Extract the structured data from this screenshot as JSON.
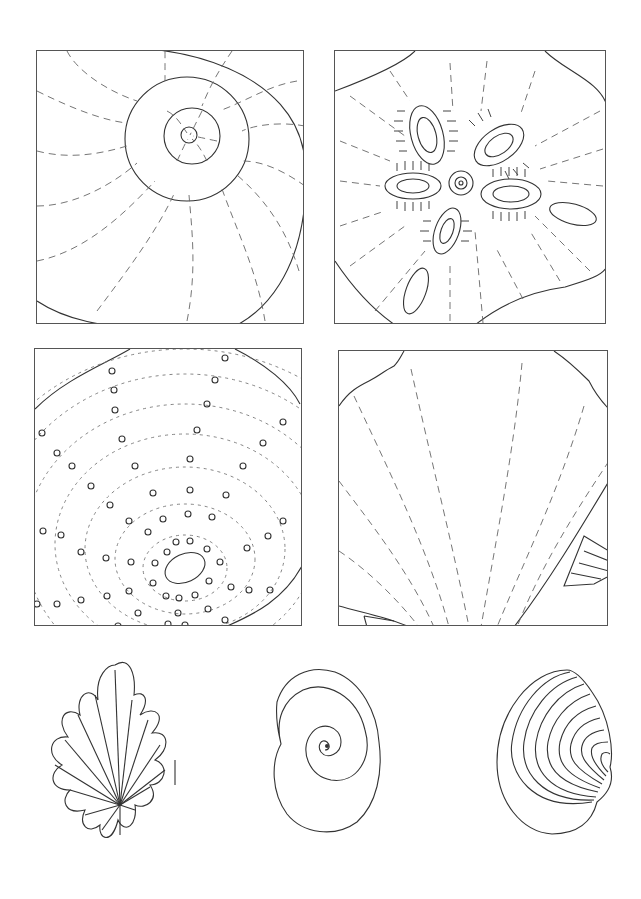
{
  "page": {
    "background": "#ffffff",
    "line_color": "#333333",
    "dash_color": "#666666"
  },
  "panels": [
    {
      "id": "nautilus-spiral",
      "x": 36,
      "y": 50,
      "w": 268,
      "h": 274
    },
    {
      "id": "sand-dollar",
      "x": 334,
      "y": 50,
      "w": 272,
      "h": 274
    },
    {
      "id": "spiral-dots-shell",
      "x": 34,
      "y": 348,
      "w": 268,
      "h": 278
    },
    {
      "id": "scallop-fan",
      "x": 338,
      "y": 350,
      "w": 270,
      "h": 276
    }
  ],
  "bottom_shells": [
    {
      "id": "fluted-shell",
      "x": 45,
      "y": 660,
      "w": 120,
      "h": 185
    },
    {
      "id": "moon-snail-spiral",
      "x": 265,
      "y": 665,
      "w": 110,
      "h": 175
    },
    {
      "id": "ribbed-clam",
      "x": 495,
      "y": 665,
      "w": 110,
      "h": 170
    }
  ]
}
